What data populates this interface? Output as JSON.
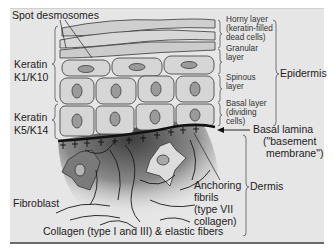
{
  "diagram": {
    "labels": {
      "spot_desmosomes": "Spot desmosomes",
      "keratin_upper_1": "Keratin",
      "keratin_upper_2": "K1/K10",
      "keratin_lower_1": "Keratin",
      "keratin_lower_2": "K5/K14",
      "horny_1": "Horny layer",
      "horny_2": "(keratin-filled",
      "horny_3": "dead cells)",
      "granular_1": "Granular",
      "granular_2": "layer",
      "spinous_1": "Spinous",
      "spinous_2": "layer",
      "basal_1": "Basal layer",
      "basal_2": "(dividing",
      "basal_3": "cells)",
      "epidermis": "Epidermis",
      "basal_lamina_1": "Basal lamina",
      "basal_lamina_2": "(\"basement",
      "basal_lamina_3": "membrane\")",
      "anchoring_1": "Anchoring",
      "anchoring_2": "fibrils",
      "anchoring_3": "(type VII",
      "anchoring_4": "collagen)",
      "dermis": "Dermis",
      "fibroblast": "Fibroblast",
      "collagen": "Collagen (type I and III) & elastic fibers"
    },
    "colors": {
      "background": "#e6e6e6",
      "cell_fill": "#d4d4d4",
      "cell_stroke": "#555555",
      "nucleus": "#9a9a9a",
      "lamina": "#111111",
      "dermis_dark": "#5a5a5a"
    }
  }
}
